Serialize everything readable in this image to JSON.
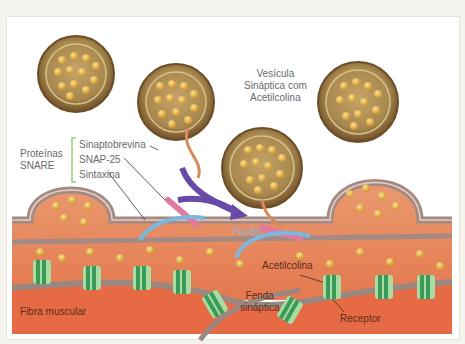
{
  "diagram": {
    "labels": {
      "vesicle": [
        "Vesícula",
        "Sináptica com",
        "Acetilcolina"
      ],
      "snare_group": [
        "Proteínas",
        "SNARE"
      ],
      "snare_items": [
        "Sinaptobrevina",
        "SNAP-25",
        "Sintaxina"
      ],
      "fusion": "Fusão",
      "acetylcholine": "Acetilcolina",
      "synaptic_cleft": [
        "Fenda",
        "sináptica"
      ],
      "receptor": "Receptor",
      "muscle_fiber": "Fibra muscular"
    },
    "colors": {
      "vesicle_outer": "#8a6a3a",
      "vesicle_inner": "#b89a5a",
      "acetylcholine": "#e8b84a",
      "terminal": "#e8805a",
      "membrane": "#a88a80",
      "snare_bracket": "#9acd7a",
      "synaptobrevin": "#d88a5a",
      "snap25": "#e07aa0",
      "syntaxin": "#7ab8e0",
      "arrow": "#6a4aa8",
      "receptor": "#3a9a5a",
      "receptor_light": "#a8dca0"
    }
  }
}
